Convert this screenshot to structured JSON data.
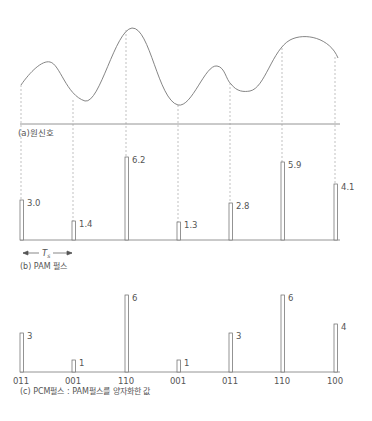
{
  "figure": {
    "panel_a": {
      "caption": "(a)원신호"
    },
    "panel_b": {
      "caption": "(b) PAM 펄스",
      "period_label": "T",
      "period_sub": "s",
      "pulses": [
        {
          "x": 21,
          "value": "3.0",
          "height": 40
        },
        {
          "x": 73,
          "value": "1.4",
          "height": 19
        },
        {
          "x": 126,
          "value": "6.2",
          "height": 83
        },
        {
          "x": 178,
          "value": "1.3",
          "height": 18
        },
        {
          "x": 230,
          "value": "2.8",
          "height": 37
        },
        {
          "x": 282,
          "value": "5.9",
          "height": 78
        },
        {
          "x": 335,
          "value": "4.1",
          "height": 56
        }
      ]
    },
    "panel_c": {
      "caption": "(c) PCM펄스 : PAM펄스를 양자화한 값",
      "pulses": [
        {
          "x": 21,
          "value": "3",
          "code": "011",
          "height": 39
        },
        {
          "x": 73,
          "value": "1",
          "code": "001",
          "height": 12
        },
        {
          "x": 126,
          "value": "6",
          "code": "110",
          "height": 77
        },
        {
          "x": 178,
          "value": "1",
          "code": "001",
          "height": 12
        },
        {
          "x": 230,
          "value": "3",
          "code": "011",
          "height": 39
        },
        {
          "x": 282,
          "value": "6",
          "code": "110",
          "height": 77
        },
        {
          "x": 335,
          "value": "4",
          "code": "100",
          "height": 48
        }
      ]
    }
  },
  "colors": {
    "line": "#777777",
    "text": "#555555"
  }
}
